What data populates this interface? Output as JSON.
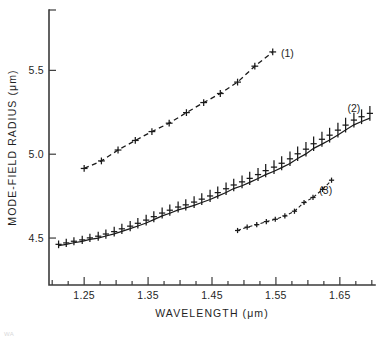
{
  "chart_data": {
    "type": "line",
    "title": "",
    "xlabel": "WAVELENGTH (μm)",
    "ylabel": "MODE-FIELD RADIUS (μm)",
    "xlim": [
      1.195,
      1.705
    ],
    "ylim": [
      4.22,
      5.86
    ],
    "grid": false,
    "legend_position": "inline-right",
    "x_major_ticks": [
      1.25,
      1.35,
      1.45,
      1.55,
      1.65
    ],
    "x_major_ticklabels": [
      "1.25",
      "1.35",
      "1.45",
      "1.55",
      "1.65"
    ],
    "x_minor_ticks": [
      1.2,
      1.3,
      1.4,
      1.5,
      1.6,
      1.7
    ],
    "y_major_ticks": [
      4.5,
      5.0,
      5.5
    ],
    "y_major_ticklabels": [
      "4.5",
      "5.0",
      "5.5"
    ],
    "marker": "plus",
    "series": [
      {
        "name": "(1)",
        "label": "(1)",
        "linestyle": "dashed",
        "color": "#1a1a1a",
        "label_x": 1.568,
        "label_y": 5.58,
        "x": [
          1.25,
          1.277,
          1.303,
          1.33,
          1.356,
          1.383,
          1.41,
          1.437,
          1.463,
          1.49,
          1.517,
          1.545
        ],
        "y": [
          4.915,
          4.96,
          5.025,
          5.082,
          5.135,
          5.185,
          5.248,
          5.308,
          5.362,
          5.43,
          5.525,
          5.61
        ]
      },
      {
        "name": "(2)",
        "label": "(2)",
        "linestyle": "solid",
        "color": "#1a1a1a",
        "label_x": 1.672,
        "label_y": 5.25,
        "x": [
          1.21,
          1.222,
          1.234,
          1.247,
          1.259,
          1.272,
          1.284,
          1.297,
          1.309,
          1.322,
          1.334,
          1.347,
          1.359,
          1.372,
          1.384,
          1.397,
          1.409,
          1.422,
          1.434,
          1.447,
          1.459,
          1.472,
          1.484,
          1.497,
          1.509,
          1.522,
          1.534,
          1.547,
          1.559,
          1.572,
          1.584,
          1.597,
          1.609,
          1.622,
          1.634,
          1.647,
          1.659,
          1.672,
          1.684,
          1.697
        ],
        "y": [
          4.455,
          4.462,
          4.472,
          4.48,
          4.492,
          4.5,
          4.512,
          4.525,
          4.54,
          4.556,
          4.572,
          4.59,
          4.61,
          4.632,
          4.648,
          4.668,
          4.68,
          4.695,
          4.712,
          4.73,
          4.75,
          4.772,
          4.795,
          4.812,
          4.832,
          4.855,
          4.878,
          4.898,
          4.92,
          4.945,
          4.975,
          5.002,
          5.035,
          5.06,
          5.085,
          5.115,
          5.145,
          5.175,
          5.195,
          5.215
        ]
      },
      {
        "name": "(3)",
        "label": "(3)",
        "linestyle": "dashed",
        "color": "#1a1a1a",
        "label_x": 1.628,
        "label_y": 4.76,
        "x": [
          1.49,
          1.505,
          1.52,
          1.535,
          1.549,
          1.564,
          1.579,
          1.594,
          1.608,
          1.623,
          1.637
        ],
        "y": [
          4.545,
          4.565,
          4.58,
          4.598,
          4.612,
          4.632,
          4.66,
          4.712,
          4.742,
          4.79,
          4.845
        ]
      }
    ],
    "series2_upper_band": {
      "note": "series (2) upper scatter branch",
      "x": [
        1.21,
        1.222,
        1.234,
        1.247,
        1.259,
        1.272,
        1.284,
        1.297,
        1.309,
        1.322,
        1.334,
        1.347,
        1.359,
        1.372,
        1.384,
        1.397,
        1.409,
        1.422,
        1.434,
        1.447,
        1.459,
        1.472,
        1.484,
        1.497,
        1.509,
        1.522,
        1.534,
        1.547,
        1.559,
        1.572,
        1.584,
        1.597,
        1.609,
        1.622,
        1.634,
        1.647,
        1.659,
        1.672,
        1.684,
        1.697
      ],
      "y": [
        4.47,
        4.48,
        4.49,
        4.498,
        4.51,
        4.522,
        4.536,
        4.552,
        4.57,
        4.586,
        4.604,
        4.624,
        4.645,
        4.666,
        4.684,
        4.702,
        4.716,
        4.734,
        4.752,
        4.772,
        4.792,
        4.816,
        4.838,
        4.858,
        4.88,
        4.902,
        4.926,
        4.948,
        4.972,
        5.0,
        5.03,
        5.058,
        5.09,
        5.118,
        5.142,
        5.172,
        5.202,
        5.232,
        5.252,
        5.272
      ]
    }
  },
  "caption": "WA"
}
